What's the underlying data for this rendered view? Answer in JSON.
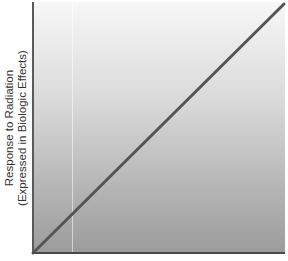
{
  "chart_data": {
    "type": "line",
    "title": "",
    "xlabel": "",
    "ylabel": "Response to Radiation (Expressed in Biologic Effects)",
    "ylabel_lines": [
      "Response to Radiation",
      "(Expressed in Biologic Effects)"
    ],
    "x": [
      0,
      1
    ],
    "series": [
      {
        "name": "Linear dose-response",
        "values": [
          0,
          1
        ],
        "color": "#555555"
      }
    ],
    "xlim": [
      0,
      1
    ],
    "ylim": [
      0,
      1
    ],
    "grid": false,
    "legend": "none",
    "tick_labels": false,
    "background": "gradient white-to-gray"
  },
  "colors": {
    "line": "#555555",
    "axis": "#4a4a4a",
    "gradient_top": "#f7f7f7",
    "gradient_bottom": "#9c9c9c"
  }
}
